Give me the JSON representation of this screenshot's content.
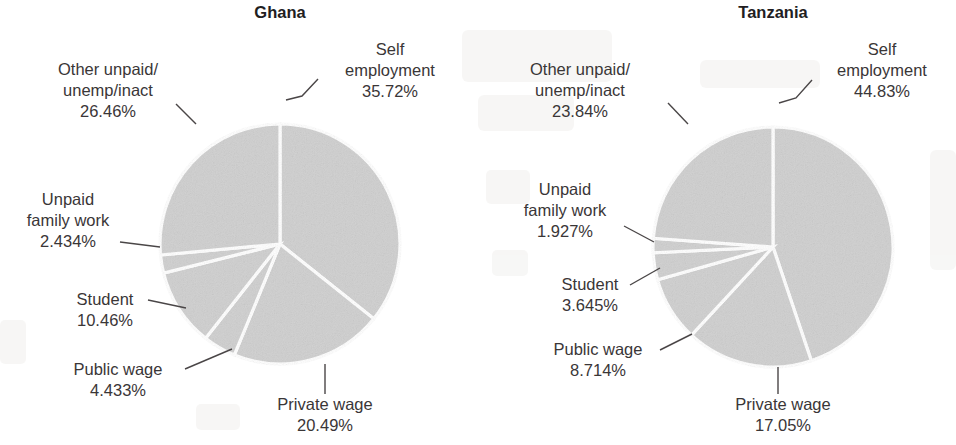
{
  "figure": {
    "background_color": "#ffffff",
    "slice_fill_color": "#cfcfcf",
    "slice_separator_color": "#ffffff",
    "text_color": "#3a3637",
    "title_color": "#221e1f"
  },
  "charts": [
    {
      "title": "Ghana",
      "center_x": 280,
      "center_y": 244,
      "radius": 120,
      "labels": [
        {
          "name": "self-employment",
          "lines": [
            "Self",
            "employment",
            "35.72%"
          ],
          "text_x": 390,
          "text_y": 55,
          "anchor": "middle",
          "leader": "M 286,100 L 302,96 L 318,79"
        },
        {
          "name": "other-unpaid-unemp-inact",
          "lines": [
            "Other unpaid/",
            "unemp/inact",
            "26.46%"
          ],
          "text_x": 108,
          "text_y": 75,
          "anchor": "middle",
          "leader": "M 196,124 L 176,104"
        },
        {
          "name": "unpaid-family-work",
          "lines": [
            "Unpaid",
            "family work",
            "2.434%"
          ],
          "text_x": 68,
          "text_y": 205,
          "anchor": "middle",
          "leader": "M 160,247 L 120,242"
        },
        {
          "name": "student",
          "lines": [
            "Student",
            "10.46%"
          ],
          "text_x": 105,
          "text_y": 305,
          "anchor": "middle",
          "leader": "M 186,308 L 148,300"
        },
        {
          "name": "public-wage",
          "lines": [
            "Public wage",
            "4.433%"
          ],
          "text_x": 118,
          "text_y": 375,
          "anchor": "middle",
          "leader": "M 232,349 L 185,369"
        },
        {
          "name": "private-wage",
          "lines": [
            "Private wage",
            "20.49%"
          ],
          "text_x": 325,
          "text_y": 410,
          "anchor": "middle",
          "leader": "M 325,364 L 325,394"
        }
      ]
    },
    {
      "title": "Tanzania",
      "center_x": 773,
      "center_y": 247,
      "radius": 120,
      "labels": [
        {
          "name": "self-employment",
          "lines": [
            "Self",
            "employment",
            "44.83%"
          ],
          "text_x": 882,
          "text_y": 55,
          "anchor": "middle",
          "leader": "M 779,103 L 796,98 L 812,80"
        },
        {
          "name": "other-unpaid-unemp-inact",
          "lines": [
            "Other unpaid/",
            "unemp/inact",
            "23.84%"
          ],
          "text_x": 580,
          "text_y": 75,
          "anchor": "middle",
          "leader": "M 688,124 L 668,103"
        },
        {
          "name": "unpaid-family-work",
          "lines": [
            "Unpaid",
            "family work",
            "1.927%"
          ],
          "text_x": 565,
          "text_y": 195,
          "anchor": "middle",
          "leader": "M 654,242 L 624,226"
        },
        {
          "name": "student",
          "lines": [
            "Student",
            "3.645%"
          ],
          "text_x": 590,
          "text_y": 290,
          "anchor": "middle",
          "leader": "M 660,268 L 630,285"
        },
        {
          "name": "public-wage",
          "lines": [
            "Public wage",
            "8.714%"
          ],
          "text_x": 598,
          "text_y": 355,
          "anchor": "middle",
          "leader": "M 692,334 L 660,350"
        },
        {
          "name": "private-wage",
          "lines": [
            "Private wage",
            "17.05%"
          ],
          "text_x": 783,
          "text_y": 410,
          "anchor": "middle",
          "leader": "M 778,367 L 778,394"
        }
      ]
    }
  ],
  "chart_data": [
    {
      "type": "pie",
      "title": "Ghana",
      "xlabel": "",
      "ylabel": "",
      "categories": [
        "Self employment",
        "Private wage",
        "Public wage",
        "Student",
        "Unpaid family work",
        "Other unpaid/unemp/inact"
      ],
      "values": [
        35.72,
        20.49,
        4.433,
        10.46,
        2.434,
        26.46
      ],
      "value_labels": [
        "35.72%",
        "20.49%",
        "4.433%",
        "10.46%",
        "2.434%",
        "26.46%"
      ],
      "units": "percent",
      "start_angle_deg": 0,
      "direction": "clockwise",
      "legend": "none",
      "labels_position": "outside-with-leader-lines"
    },
    {
      "type": "pie",
      "title": "Tanzania",
      "xlabel": "",
      "ylabel": "",
      "categories": [
        "Self employment",
        "Private wage",
        "Public wage",
        "Student",
        "Unpaid family work",
        "Other unpaid/unemp/inact"
      ],
      "values": [
        44.83,
        17.05,
        8.714,
        3.645,
        1.927,
        23.84
      ],
      "value_labels": [
        "44.83%",
        "17.05%",
        "8.714%",
        "3.645%",
        "1.927%",
        "23.84%"
      ],
      "units": "percent",
      "start_angle_deg": 0,
      "direction": "clockwise",
      "legend": "none",
      "labels_position": "outside-with-leader-lines"
    }
  ]
}
